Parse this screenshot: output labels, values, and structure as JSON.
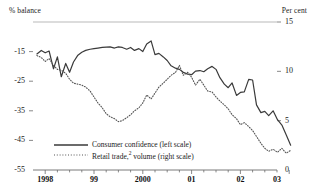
{
  "chart_data": {
    "type": "line",
    "title": "",
    "ylabel": "% balance",
    "ylabel_right": "Per cent",
    "xlabel": "",
    "ylim": [
      -55,
      -5
    ],
    "ylim_right": [
      0,
      15
    ],
    "yticks": [
      -15,
      -25,
      -35,
      -45,
      -55
    ],
    "yticks_right": [
      15,
      10,
      5,
      0
    ],
    "xticks": [
      "1998",
      "99",
      "2000",
      "01",
      "02",
      "03"
    ],
    "xlim": [
      "1997.75",
      "2002.75"
    ],
    "grid": false,
    "legend_position": "lower-left",
    "series": [
      {
        "name": "Consumer confidence (left scale)",
        "axis": "left",
        "style": "solid",
        "color": "#3a3a3a",
        "x": [
          1997.83,
          1997.92,
          1998.0,
          1998.08,
          1998.17,
          1998.25,
          1998.33,
          1998.42,
          1998.5,
          1998.58,
          1998.67,
          1998.75,
          1998.83,
          1998.92,
          1999.0,
          1999.08,
          1999.17,
          1999.25,
          1999.33,
          1999.42,
          1999.5,
          1999.58,
          1999.67,
          1999.75,
          1999.83,
          1999.92,
          2000.0,
          2000.08,
          2000.17,
          2000.25,
          2000.33,
          2000.42,
          2000.5,
          2000.58,
          2000.67,
          2000.75,
          2000.83,
          2000.92,
          2001.0,
          2001.08,
          2001.17,
          2001.25,
          2001.33,
          2001.42,
          2001.5,
          2001.58,
          2001.67,
          2001.75,
          2001.83,
          2001.92,
          2002.0,
          2002.08,
          2002.17,
          2002.25,
          2002.33,
          2002.42,
          2002.5,
          2002.58,
          2002.67
        ],
        "values": [
          -15.8,
          -14.6,
          -15.4,
          -14.8,
          -20.8,
          -16.8,
          -23.5,
          -19.0,
          -22.0,
          -18.5,
          -16.2,
          -15.2,
          -14.6,
          -14.2,
          -14.0,
          -13.8,
          -13.6,
          -13.5,
          -13.4,
          -13.8,
          -13.4,
          -13.6,
          -14.2,
          -13.6,
          -14.6,
          -14.0,
          -15.0,
          -12.4,
          -11.4,
          -16.0,
          -15.6,
          -16.8,
          -18.0,
          -19.8,
          -20.6,
          -21.0,
          -22.0,
          -22.6,
          -22.8,
          -21.6,
          -21.4,
          -21.8,
          -20.8,
          -20.0,
          -21.0,
          -23.8,
          -26.0,
          -27.2,
          -25.6,
          -29.8,
          -28.8,
          -28.6,
          -24.4,
          -24.6,
          -33.0,
          -35.6,
          -35.2,
          -36.6,
          -35.0
        ],
        "values_tail": [
          -38.0,
          -39.8,
          -43.2,
          -46.6
        ]
      },
      {
        "name": "Retail trade,2 volume (right scale)",
        "axis": "right",
        "style": "dotted",
        "color": "#555555",
        "x": [
          1997.83,
          1997.92,
          1998.0,
          1998.08,
          1998.17,
          1998.25,
          1998.33,
          1998.42,
          1998.5,
          1998.58,
          1998.67,
          1998.75,
          1998.83,
          1998.92,
          1999.0,
          1999.08,
          1999.17,
          1999.25,
          1999.33,
          1999.42,
          1999.5,
          1999.58,
          1999.67,
          1999.75,
          1999.83,
          1999.92,
          2000.0,
          2000.08,
          2000.17,
          2000.25,
          2000.33,
          2000.42,
          2000.5,
          2000.58,
          2000.67,
          2000.75,
          2000.83,
          2000.92,
          2001.0,
          2001.08,
          2001.17,
          2001.25,
          2001.33,
          2001.42,
          2001.5,
          2001.58,
          2001.67,
          2001.75,
          2001.83,
          2001.92,
          2002.0,
          2002.08,
          2002.17,
          2002.25,
          2002.33,
          2002.42,
          2002.5,
          2002.58,
          2002.67
        ],
        "values": [
          11.6,
          11.4,
          11.0,
          11.3,
          10.6,
          10.2,
          10.1,
          9.8,
          9.2,
          8.8,
          8.7,
          8.6,
          8.4,
          8.0,
          7.4,
          6.8,
          6.3,
          5.7,
          5.4,
          5.2,
          4.9,
          5.0,
          5.3,
          5.6,
          6.0,
          6.3,
          6.8,
          7.6,
          7.2,
          7.8,
          8.4,
          8.8,
          9.2,
          9.6,
          9.9,
          10.6,
          9.6,
          9.9,
          9.4,
          8.6,
          9.2,
          8.6,
          8.0,
          7.9,
          7.4,
          7.0,
          6.6,
          6.2,
          5.6,
          5.2,
          4.6,
          4.8,
          4.4,
          4.0,
          3.4,
          2.7,
          2.2,
          1.9,
          2.1
        ],
        "values_tail": [
          1.8,
          2.2,
          1.7,
          2.0
        ]
      }
    ]
  },
  "legend": {
    "items": [
      {
        "label": "Consumer confidence (left scale)",
        "style": "solid"
      },
      {
        "label_pre": "Retail trade,",
        "label_sup": "2",
        "label_post": " volume (right scale)",
        "style": "dotted"
      }
    ]
  },
  "axes": {
    "left_title": "% balance",
    "right_title": "Per cent",
    "left_ticks": [
      "-15",
      "-25",
      "-35",
      "-45",
      "-55"
    ],
    "right_ticks": [
      "15",
      "10",
      "5",
      "0"
    ],
    "x_ticks": [
      "1998",
      "99",
      "2000",
      "01",
      "02",
      "03"
    ]
  },
  "colors": {
    "line_solid": "#3a3a3a",
    "line_dotted": "#555555",
    "axis": "#6b6b6b",
    "top_rule": "#b9b9b9",
    "text": "#1a1a1a"
  }
}
